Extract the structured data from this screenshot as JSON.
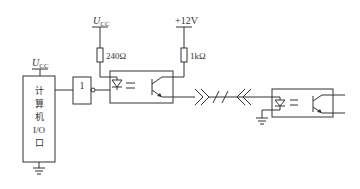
{
  "diagram": {
    "computer_block": {
      "label_lines": [
        "计",
        "算",
        "机",
        "I/O",
        "口"
      ],
      "supply_label": "U",
      "supply_sub": "CC"
    },
    "inverter": {
      "label": "1"
    },
    "resistor_1": {
      "value": "240Ω",
      "supply_label": "U",
      "supply_sub": "CC"
    },
    "resistor_2": {
      "value": "1kΩ",
      "supply_label": "+12V"
    },
    "optocoupler_tx": {
      "name": "transmitter optocoupler"
    },
    "cable": {
      "name": "transmission line"
    },
    "optocoupler_rx": {
      "name": "receiver optocoupler"
    }
  }
}
